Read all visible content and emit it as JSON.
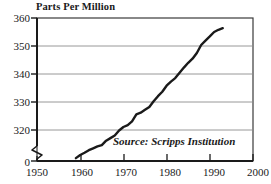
{
  "chart_data": {
    "type": "line",
    "title": "Parts Per Million",
    "ylabel": "Parts Per Million",
    "xlabel": "",
    "annotation": "Source: Scripps Institution",
    "grid": true,
    "legend": "none",
    "xlim": [
      1950,
      2000
    ],
    "ylim": [
      315,
      360
    ],
    "y_axis_break": true,
    "y_break_label": "0",
    "xticks": [
      "1950",
      "1960",
      "1970",
      "1980",
      "1990",
      "2000"
    ],
    "xtick_values": [
      1950,
      1960,
      1970,
      1980,
      1990,
      2000
    ],
    "yticks": [
      "320",
      "330",
      "340",
      "350",
      "360"
    ],
    "ytick_values": [
      320,
      330,
      340,
      350,
      360
    ],
    "series": [
      {
        "name": "Atmospheric CO2 concentration",
        "color": "#1a1a1a",
        "x": [
          1959,
          1960,
          1961,
          1962,
          1963,
          1964,
          1965,
          1966,
          1967,
          1968,
          1969,
          1970,
          1971,
          1972,
          1973,
          1974,
          1975,
          1976,
          1977,
          1978,
          1979,
          1980,
          1981,
          1982,
          1983,
          1984,
          1985,
          1986,
          1987,
          1988,
          1989,
          1990,
          1991,
          1992,
          1993
        ],
        "values": [
          315.9,
          316.9,
          317.6,
          318.4,
          319.0,
          319.6,
          320.0,
          321.4,
          322.2,
          323.0,
          324.6,
          325.7,
          326.3,
          327.5,
          329.7,
          330.2,
          331.1,
          332.0,
          333.8,
          335.4,
          336.8,
          338.7,
          340.0,
          341.1,
          342.8,
          344.4,
          345.9,
          347.2,
          349.0,
          351.5,
          352.9,
          354.2,
          355.6,
          356.3,
          356.8
        ]
      }
    ]
  },
  "figure": {
    "title_text": "Parts Per Million",
    "source_text": "Source: Scripps Institution",
    "zero_label": "0"
  }
}
